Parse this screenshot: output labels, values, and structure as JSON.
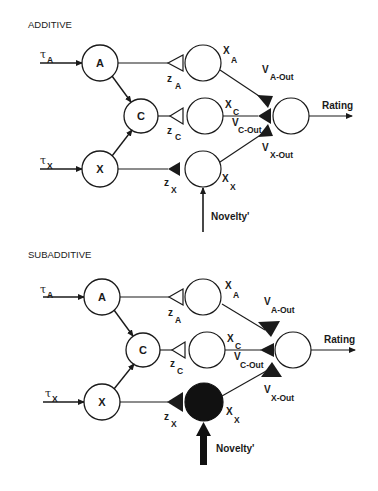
{
  "panels": [
    {
      "title": "ADDITIVE",
      "inputs": {
        "tau_a": "τ",
        "tau_a_sub": "A",
        "tau_x": "τ",
        "tau_x_sub": "X"
      },
      "nodes": {
        "a": "A",
        "c": "C",
        "x": "X"
      },
      "weights": {
        "z_a": "z",
        "z_a_sub": "A",
        "z_c": "z",
        "z_c_sub": "C",
        "z_x": "z",
        "z_x_sub": "X"
      },
      "activations": {
        "x_a": "X",
        "x_a_sub": "A",
        "x_c": "X",
        "x_c_sub": "C",
        "x_x": "X",
        "x_x_sub": "X"
      },
      "outputs": {
        "v_a": "V",
        "v_a_sub": "A-Out",
        "v_c": "V",
        "v_c_sub": "C-Out",
        "v_x": "V",
        "v_x_sub": "X-Out"
      },
      "rating_label": "Rating",
      "novelty_label": "Novelty'",
      "novelty_strength": "weak",
      "x_unit_state": "inactive"
    },
    {
      "title": "SUBADDITIVE",
      "inputs": {
        "tau_a": "τ",
        "tau_a_sub": "A",
        "tau_x": "τ",
        "tau_x_sub": "X"
      },
      "nodes": {
        "a": "A",
        "c": "C",
        "x": "X"
      },
      "weights": {
        "z_a": "z",
        "z_a_sub": "A",
        "z_c": "z",
        "z_c_sub": "C",
        "z_x": "z",
        "z_x_sub": "X"
      },
      "activations": {
        "x_a": "X",
        "x_a_sub": "A",
        "x_c": "X",
        "x_c_sub": "C",
        "x_x": "X",
        "x_x_sub": "X"
      },
      "outputs": {
        "v_a": "V",
        "v_a_sub": "A-Out",
        "v_c": "V",
        "v_c_sub": "C-Out",
        "v_x": "V",
        "v_x_sub": "X-Out"
      },
      "rating_label": "Rating",
      "novelty_label": "Novelty'",
      "novelty_strength": "strong",
      "x_unit_state": "active"
    }
  ],
  "colors": {
    "ink": "#1a1a1a",
    "background": "#ffffff"
  }
}
